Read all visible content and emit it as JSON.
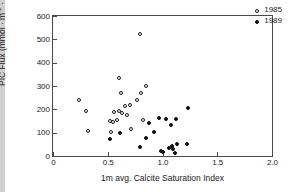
{
  "chart_data": {
    "type": "scatter",
    "title": "",
    "xlabel": "1m avg. Calcite Saturation Index",
    "ylabel": "PIC Flux (mmol · m-2 · d-1)",
    "ylabel_parts": {
      "prefix": "PIC Flux (mmol · m",
      "sup1": "-2",
      "middle": " · d",
      "sup2": "-1",
      "suffix": ")"
    },
    "xlim": [
      0,
      2.0
    ],
    "ylim": [
      0,
      600
    ],
    "xticks": [
      "0",
      "0.5",
      "1.0",
      "1.5",
      "2.0"
    ],
    "xtick_values": [
      0,
      0.5,
      1.0,
      1.5,
      2.0
    ],
    "yticks": [
      "0",
      "100",
      "200",
      "300",
      "400",
      "500",
      "600"
    ],
    "ytick_values": [
      0,
      100,
      200,
      300,
      400,
      500,
      600
    ],
    "grid": false,
    "legend_position": "top-right",
    "series": [
      {
        "name": "1985",
        "marker": "open-circle",
        "color": "#1a1a1a",
        "points": [
          [
            0.24,
            238
          ],
          [
            0.3,
            192
          ],
          [
            0.32,
            107
          ],
          [
            0.52,
            148
          ],
          [
            0.53,
            102
          ],
          [
            0.55,
            146
          ],
          [
            0.56,
            188
          ],
          [
            0.58,
            156
          ],
          [
            0.6,
            333
          ],
          [
            0.6,
            192
          ],
          [
            0.62,
            268
          ],
          [
            0.63,
            185
          ],
          [
            0.66,
            216
          ],
          [
            0.68,
            176
          ],
          [
            0.7,
            220
          ],
          [
            0.71,
            116
          ],
          [
            0.77,
            240
          ],
          [
            0.79,
            523
          ],
          [
            0.8,
            272
          ],
          [
            0.82,
            154
          ],
          [
            0.85,
            299
          ]
        ]
      },
      {
        "name": "1989",
        "marker": "filled-circle",
        "color": "#101010",
        "points": [
          [
            0.52,
            72
          ],
          [
            0.61,
            97
          ],
          [
            0.79,
            38
          ],
          [
            0.85,
            76
          ],
          [
            0.88,
            140
          ],
          [
            0.92,
            105
          ],
          [
            0.97,
            162
          ],
          [
            0.99,
            22
          ],
          [
            1.0,
            18
          ],
          [
            1.03,
            158
          ],
          [
            1.06,
            34
          ],
          [
            1.08,
            135
          ],
          [
            1.09,
            42
          ],
          [
            1.1,
            30
          ],
          [
            1.11,
            12
          ],
          [
            1.12,
            160
          ],
          [
            1.13,
            50
          ],
          [
            1.22,
            52
          ],
          [
            1.23,
            204
          ]
        ]
      }
    ]
  },
  "legend": {
    "entries": [
      {
        "label": "1985",
        "marker": "open-circle"
      },
      {
        "label": "1989",
        "marker": "filled-circle"
      }
    ]
  }
}
